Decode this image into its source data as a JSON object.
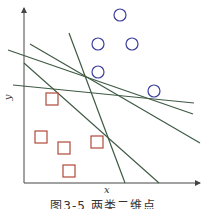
{
  "figure": {
    "caption": "图3-5  两类二维点",
    "x_label": "x",
    "y_label": "y",
    "colors": {
      "axis": "#444444",
      "line": "#3e5a44",
      "circle": "#3b3f9a",
      "square": "#b0483a"
    },
    "circles": [
      {
        "cx": 120,
        "cy": 15
      },
      {
        "cx": 98,
        "cy": 44
      },
      {
        "cx": 132,
        "cy": 44
      },
      {
        "cx": 98,
        "cy": 72
      },
      {
        "cx": 154,
        "cy": 91
      }
    ],
    "squares": [
      {
        "x": 46,
        "y": 93
      },
      {
        "x": 35,
        "y": 131
      },
      {
        "x": 58,
        "y": 142
      },
      {
        "x": 91,
        "y": 136
      },
      {
        "x": 63,
        "y": 165
      }
    ],
    "separating_lines": [
      {
        "x1": 13,
        "y1": 85,
        "x2": 194,
        "y2": 103
      },
      {
        "x1": 8,
        "y1": 50,
        "x2": 193,
        "y2": 114
      },
      {
        "x1": 30,
        "y1": 44,
        "x2": 200,
        "y2": 143
      },
      {
        "x1": 69,
        "y1": 33,
        "x2": 125,
        "y2": 183
      },
      {
        "x1": 24,
        "y1": 63,
        "x2": 159,
        "y2": 183
      }
    ]
  }
}
